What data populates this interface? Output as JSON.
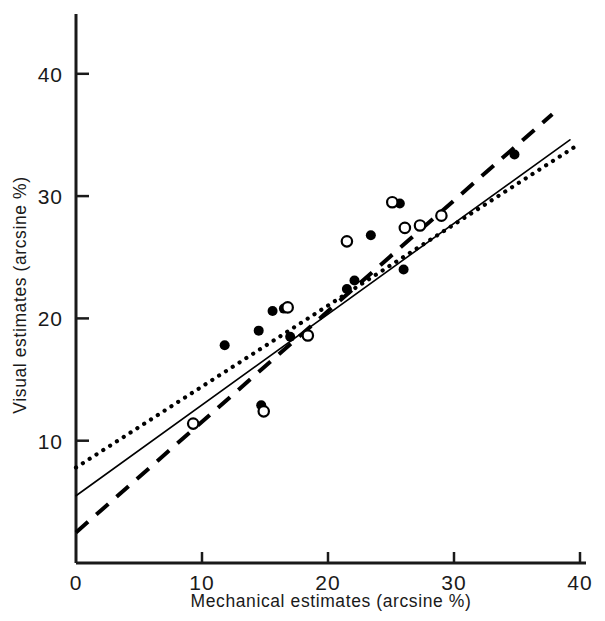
{
  "chart_data": {
    "type": "scatter",
    "title": "",
    "xlabel": "Mechanical estimates (arcsine %)",
    "ylabel": "Visual estimates (arcsine %)",
    "xlim": [
      0,
      41.5
    ],
    "ylim": [
      0,
      45
    ],
    "xticks": [
      0,
      10,
      20,
      30,
      40
    ],
    "xtick_labels": [
      "0",
      "10",
      "20",
      "30",
      "40"
    ],
    "yticks": [
      10,
      20,
      30,
      40
    ],
    "ytick_labels": [
      "10",
      "20",
      "30",
      "40"
    ],
    "grid": false,
    "legend": "none",
    "axis_color": "#1a1a1a",
    "marker_color": "#000000",
    "series": [
      {
        "name": "filled-circles",
        "marker": "filled-circle",
        "points": [
          [
            11.8,
            17.8
          ],
          [
            14.5,
            19.0
          ],
          [
            14.7,
            12.9
          ],
          [
            15.6,
            20.6
          ],
          [
            16.5,
            20.8
          ],
          [
            17.0,
            18.5
          ],
          [
            21.5,
            22.4
          ],
          [
            22.1,
            23.1
          ],
          [
            23.4,
            26.8
          ],
          [
            25.7,
            29.4
          ],
          [
            26.0,
            24.0
          ],
          [
            34.8,
            33.4
          ]
        ]
      },
      {
        "name": "open-circles",
        "marker": "open-circle",
        "points": [
          [
            9.3,
            11.4
          ],
          [
            14.9,
            12.4
          ],
          [
            16.8,
            20.9
          ],
          [
            18.4,
            18.6
          ],
          [
            21.5,
            26.3
          ],
          [
            25.1,
            29.5
          ],
          [
            26.1,
            27.4
          ],
          [
            27.3,
            27.6
          ],
          [
            29.0,
            28.4
          ]
        ]
      }
    ],
    "lines": [
      {
        "name": "dotted-regression-line",
        "style": "dotted",
        "x0": 0,
        "y0": 7.8,
        "x1": 40.0,
        "y1": 34.3
      },
      {
        "name": "solid-regression-line",
        "style": "solid",
        "x0": 0,
        "y0": 5.5,
        "x1": 39.2,
        "y1": 34.6
      },
      {
        "name": "dashed-regression-line",
        "style": "dashed",
        "x0": 0,
        "y0": 2.5,
        "x1": 37.8,
        "y1": 36.7
      }
    ]
  },
  "axes": {
    "x_label": "Mechanical estimates (arcsine %)",
    "y_label": "Visual estimates (arcsine %)"
  }
}
